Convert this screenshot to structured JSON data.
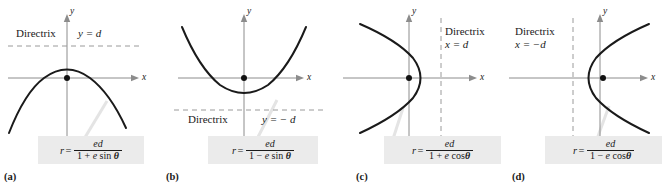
{
  "figure": {
    "background": "#ffffff",
    "curve_color": "#1a1a1a",
    "axis_color": "#8c8c8c",
    "directrix_color": "#9a9a9a",
    "formula_box_color": "#ebebeb",
    "leader_color": "#e2e2e2"
  },
  "panels": [
    {
      "tag": "(a)",
      "conic": "parabola opening downward",
      "axis": {
        "x_label": "x",
        "y_label": "y"
      },
      "directrix": {
        "word": "Directrix",
        "equation": "y = d",
        "orientation": "horizontal",
        "position": "above origin"
      },
      "formula": {
        "lhs": "r",
        "equals": "=",
        "numerator": "ed",
        "denominator_prefix": "1 + ",
        "denominator_var": "e",
        "denominator_fn": " sin ",
        "denominator_angle": "θ",
        "plain": "r = ed / (1 + e sin θ)"
      },
      "focus": "origin"
    },
    {
      "tag": "(b)",
      "conic": "parabola opening upward",
      "axis": {
        "x_label": "x",
        "y_label": "y"
      },
      "directrix": {
        "word": "Directrix",
        "equation": "y = − d",
        "orientation": "horizontal",
        "position": "below origin"
      },
      "formula": {
        "lhs": "r",
        "equals": "=",
        "numerator": "ed",
        "denominator_prefix": "1 − ",
        "denominator_var": "e",
        "denominator_fn": " sin ",
        "denominator_angle": "θ",
        "plain": "r = ed / (1 − e sin θ)"
      },
      "focus": "origin"
    },
    {
      "tag": "(c)",
      "conic": "parabola opening leftward",
      "axis": {
        "x_label": "x",
        "y_label": "y"
      },
      "directrix": {
        "word": "Directrix",
        "equation": "x = d",
        "orientation": "vertical",
        "position": "right of origin"
      },
      "formula": {
        "lhs": "r",
        "equals": "=",
        "numerator": "ed",
        "denominator_prefix": "1 + ",
        "denominator_var": "e",
        "denominator_fn": " cos",
        "denominator_angle": "θ",
        "plain": "r = ed / (1 + e cos θ)"
      },
      "focus": "origin"
    },
    {
      "tag": "(d)",
      "conic": "parabola opening rightward",
      "axis": {
        "x_label": "x",
        "y_label": "y"
      },
      "directrix": {
        "word": "Directrix",
        "equation": "x = −d",
        "orientation": "vertical",
        "position": "left of origin"
      },
      "formula": {
        "lhs": "r",
        "equals": "=",
        "numerator": "ed",
        "denominator_prefix": "1 − ",
        "denominator_var": "e",
        "denominator_fn": " cos",
        "denominator_angle": "θ",
        "plain": "r = ed / (1 − e cos θ)"
      },
      "focus": "origin"
    }
  ]
}
